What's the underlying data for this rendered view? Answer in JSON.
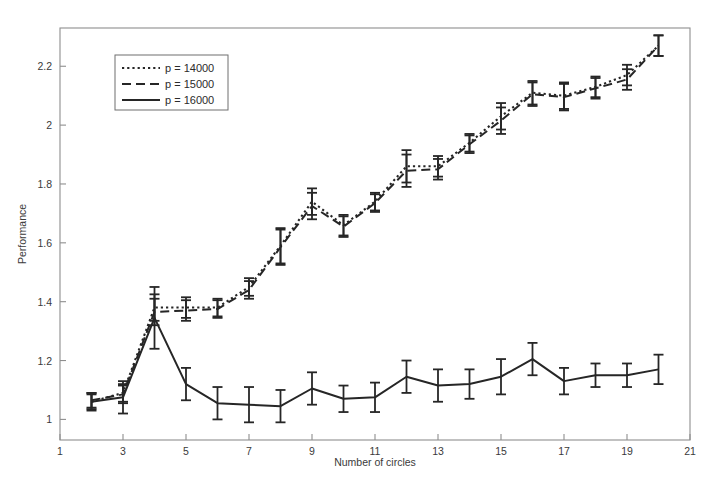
{
  "chart_data": {
    "type": "line",
    "title": "",
    "xlabel": "Number of circles",
    "ylabel": "Performance",
    "xlim": [
      1,
      21
    ],
    "ylim": [
      0.93,
      2.33
    ],
    "grid": false,
    "legend_position": "upper-left",
    "xticks": [
      1,
      3,
      5,
      7,
      9,
      11,
      13,
      15,
      17,
      19,
      21
    ],
    "xtick_labels": [
      "1",
      "3",
      "5",
      "7",
      "9",
      "11",
      "13",
      "15",
      "17",
      "19",
      "21"
    ],
    "yticks": [
      1,
      1.2,
      1.4,
      1.6,
      1.8,
      2,
      2.2
    ],
    "ytick_labels": [
      "1",
      "1.2",
      "1.4",
      "1.6",
      "1.8",
      "2",
      "2.2"
    ],
    "x": [
      2,
      3,
      4,
      5,
      6,
      7,
      8,
      9,
      10,
      11,
      12,
      13,
      14,
      15,
      16,
      17,
      18,
      19,
      20
    ],
    "series": [
      {
        "name": "p = 14000",
        "style": "dotted",
        "color": "#262626",
        "values": [
          1.06,
          1.09,
          1.38,
          1.38,
          1.38,
          1.45,
          1.59,
          1.74,
          1.66,
          1.74,
          1.86,
          1.86,
          1.94,
          2.03,
          2.11,
          2.1,
          2.13,
          2.17,
          2.27
        ],
        "errors": [
          0.025,
          0.03,
          0.045,
          0.035,
          0.03,
          0.03,
          0.06,
          0.045,
          0.035,
          0.03,
          0.055,
          0.035,
          0.03,
          0.045,
          0.04,
          0.045,
          0.035,
          0.035,
          0.035
        ]
      },
      {
        "name": "p = 15000",
        "style": "dashed",
        "color": "#262626",
        "values": [
          1.065,
          1.085,
          1.365,
          1.37,
          1.375,
          1.44,
          1.585,
          1.725,
          1.655,
          1.735,
          1.845,
          1.85,
          1.935,
          2.015,
          2.105,
          2.095,
          2.125,
          2.155,
          2.27
        ],
        "errors": [
          0.025,
          0.03,
          0.045,
          0.035,
          0.03,
          0.03,
          0.06,
          0.045,
          0.035,
          0.03,
          0.055,
          0.035,
          0.03,
          0.045,
          0.04,
          0.045,
          0.035,
          0.035,
          0.035
        ]
      },
      {
        "name": "p = 16000",
        "style": "solid",
        "color": "#262626",
        "values": [
          1.06,
          1.075,
          1.345,
          1.12,
          1.055,
          1.05,
          1.045,
          1.105,
          1.07,
          1.075,
          1.145,
          1.115,
          1.12,
          1.145,
          1.205,
          1.13,
          1.15,
          1.15,
          1.17
        ],
        "errors": [
          0.03,
          0.055,
          0.105,
          0.055,
          0.055,
          0.06,
          0.055,
          0.055,
          0.045,
          0.05,
          0.055,
          0.055,
          0.05,
          0.06,
          0.055,
          0.045,
          0.04,
          0.04,
          0.05
        ]
      }
    ]
  },
  "legend": {
    "entries": [
      {
        "label": "p = 14000",
        "style": "dotted"
      },
      {
        "label": "p = 15000",
        "style": "dashed"
      },
      {
        "label": "p = 16000",
        "style": "solid"
      }
    ]
  },
  "axes": {
    "x_title": "Number of circles",
    "y_title": "Performance"
  }
}
